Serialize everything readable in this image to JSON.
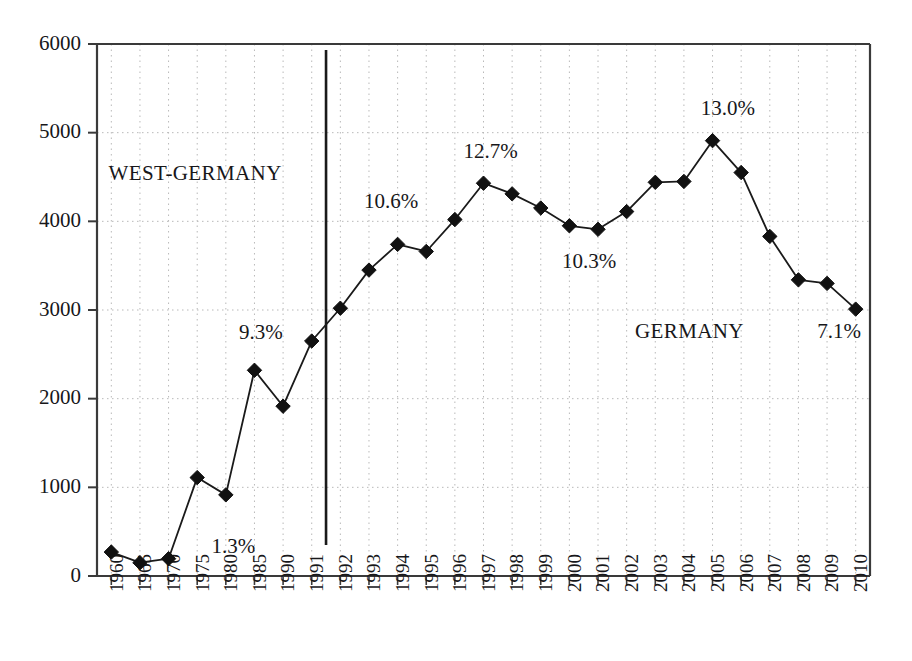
{
  "chart_data": {
    "type": "line",
    "title": "",
    "subtitle": "",
    "xlabel": "",
    "ylabel": "",
    "ylim": [
      0,
      6000
    ],
    "ytick_step": 1000,
    "yticks": [
      "0",
      "1000",
      "2000",
      "3000",
      "4000",
      "5000",
      "6000"
    ],
    "grid": true,
    "legend_position": "none",
    "marker": "diamond",
    "categories": [
      "1960",
      "1965",
      "1970",
      "1975",
      "1980",
      "1985",
      "1990",
      "1991",
      "1992",
      "1993",
      "1994",
      "1995",
      "1996",
      "1997",
      "1998",
      "1999",
      "2000",
      "2001",
      "2002",
      "2003",
      "2004",
      "2005",
      "2006",
      "2007",
      "2008",
      "2009",
      "2010"
    ],
    "series": [
      {
        "name": "",
        "values": [
          270,
          150,
          195,
          1110,
          915,
          2320,
          1915,
          2650,
          3020,
          3450,
          3740,
          3660,
          4020,
          4430,
          4310,
          4150,
          3950,
          3910,
          4110,
          4440,
          4450,
          4910,
          4550,
          3830,
          3340,
          3300,
          3010
        ]
      }
    ],
    "annotations": [
      {
        "id": "west-germany-label",
        "text": "WEST-GERMANY",
        "x_pct": 21.4,
        "y_pct": 26.5,
        "kind": "region"
      },
      {
        "id": "germany-label",
        "text": "GERMANY",
        "x_pct": 75.6,
        "y_pct": 50.4,
        "kind": "region"
      },
      {
        "id": "pct-1980",
        "text": "1.3%",
        "x_pct": 25.6,
        "y_pct": 82.9,
        "kind": "percent"
      },
      {
        "id": "pct-1985",
        "text": "9.3%",
        "x_pct": 28.6,
        "y_pct": 50.6,
        "kind": "percent"
      },
      {
        "id": "pct-1992",
        "text": "10.6%",
        "x_pct": 42.9,
        "y_pct": 30.8,
        "kind": "percent"
      },
      {
        "id": "pct-1997",
        "text": "12.7%",
        "x_pct": 53.8,
        "y_pct": 23.1,
        "kind": "percent"
      },
      {
        "id": "pct-2001",
        "text": "10.3%",
        "x_pct": 64.6,
        "y_pct": 39.8,
        "kind": "percent"
      },
      {
        "id": "pct-2005",
        "text": "13.0%",
        "x_pct": 79.8,
        "y_pct": 16.7,
        "kind": "percent"
      },
      {
        "id": "pct-2009",
        "text": "7.1%",
        "x_pct": 92.0,
        "y_pct": 50.4,
        "kind": "percent"
      }
    ],
    "divider": {
      "id": "reunification-divider",
      "between": [
        "1991",
        "1992"
      ],
      "label": ""
    },
    "colors": {
      "line": "#1a1a1a",
      "marker": "#111111",
      "grid": "#b9b9b9",
      "axis": "#3a3a3a",
      "text": "#17171a"
    }
  }
}
